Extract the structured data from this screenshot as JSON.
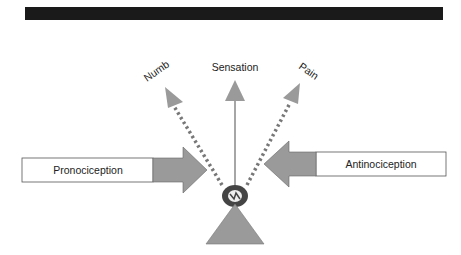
{
  "header": {
    "bar_color": "#1a1a1a"
  },
  "labels": {
    "numb": "Numb",
    "sensation": "Sensation",
    "pain": "Pain",
    "pronociception": "Pronociception",
    "antinociception": "Antinociception"
  },
  "colors": {
    "arrow_fill": "#9a9a9a",
    "shaft": "#888888",
    "dots": "#777777",
    "box_stroke": "#555555",
    "ring": "#444444"
  }
}
